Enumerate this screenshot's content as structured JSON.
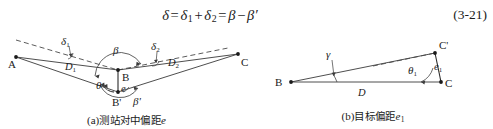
{
  "equation": {
    "lhs": "δ",
    "eq1": "=",
    "term1": "δ",
    "term1_sub": "1",
    "plus": "+",
    "term2": "δ",
    "term2_sub": "2",
    "eq2": "=",
    "term3": "β",
    "minus": "−",
    "term4": "β",
    "term4_prime": "′",
    "number": "(3-21)",
    "plain": "δ = δ1 + δ2 = β − β′"
  },
  "figure_a": {
    "caption_index": "(a)",
    "caption_text": "测站对中偏距",
    "caption_var": "e",
    "labels": {
      "A": "A",
      "B": "B",
      "B_prime": "B'",
      "C": "C",
      "D1": "D",
      "D1_sub": "1",
      "D2": "D",
      "D2_sub": "2",
      "delta1": "δ",
      "delta1_sub": "1",
      "delta2": "δ",
      "delta2_sub": "2",
      "beta": "β",
      "beta_prime": "β'",
      "theta": "θ",
      "e": "e"
    }
  },
  "figure_b": {
    "caption_index": "(b)",
    "caption_text": "目标偏距",
    "caption_var": "e",
    "caption_var_sub": "1",
    "labels": {
      "B": "B",
      "C": "C",
      "C_prime": "C'",
      "D": "D",
      "gamma": "γ",
      "theta1": "θ",
      "theta1_sub": "1",
      "e1": "e",
      "e1_sub": "1"
    }
  },
  "style": {
    "ink": "#1a1a1a",
    "line": "#3a3a3a",
    "dash": "#4a4a4a",
    "background": "#ffffff"
  }
}
